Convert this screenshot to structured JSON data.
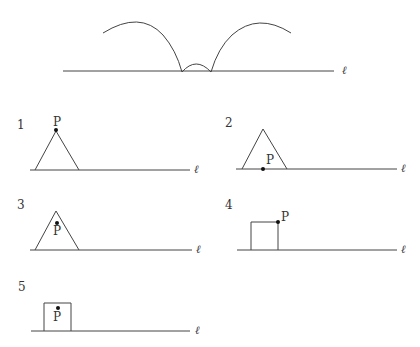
{
  "line_label": "ℓ",
  "point_label": "P",
  "top_figure": {
    "description": "Locus traced by point P as the shape rolls along line ℓ"
  },
  "options": [
    {
      "number": "1",
      "shape": "triangle",
      "point_position": "apex"
    },
    {
      "number": "2",
      "shape": "triangle",
      "point_position": "midpoint of base"
    },
    {
      "number": "3",
      "shape": "triangle",
      "point_position": "interior near apex"
    },
    {
      "number": "4",
      "shape": "square",
      "point_position": "top-right vertex"
    },
    {
      "number": "5",
      "shape": "square",
      "point_position": "interior near top center"
    }
  ]
}
